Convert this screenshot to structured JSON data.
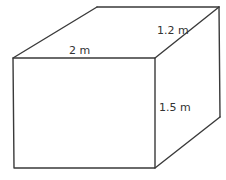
{
  "diagram": {
    "type": "rectangular-prism",
    "line_color": "#3a3a3a",
    "text_color": "#333333",
    "background": "#ffffff",
    "dimensions": {
      "length": "2 m",
      "depth": "1.2 m",
      "height": "1.5 m"
    },
    "vertices": {
      "front_top_left": [
        13,
        58
      ],
      "front_top_right": [
        155,
        58
      ],
      "front_bottom_left": [
        14,
        168
      ],
      "front_bottom_right": [
        155,
        168
      ],
      "back_top_left": [
        97,
        7
      ],
      "back_top_right": [
        219,
        7
      ],
      "back_bottom_right": [
        220,
        117
      ]
    }
  }
}
